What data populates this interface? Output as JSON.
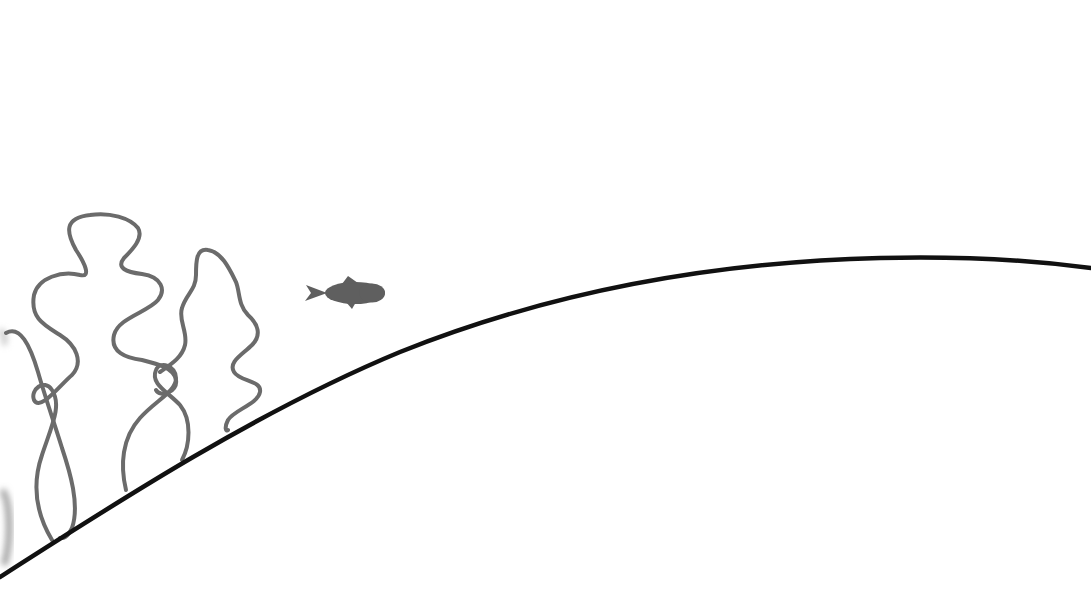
{
  "scene": {
    "description": "Underwater line illustration: seaweed and a fish above a curved seafloor",
    "background_color": "#ffffff",
    "ground": {
      "name": "seafloor-curve",
      "color": "#111111",
      "stroke_width": 4.5
    },
    "seaweed": {
      "color": "#6b6b6b",
      "stroke_width": 4,
      "strands": [
        {
          "name": "seaweed-strand-far-left"
        },
        {
          "name": "seaweed-strand-tall"
        },
        {
          "name": "seaweed-strand-middle"
        },
        {
          "name": "seaweed-strand-right"
        }
      ]
    },
    "fish": {
      "name": "fish",
      "color": "#5f5f5f",
      "facing": "right"
    },
    "edge_artifact": {
      "name": "blurred-edge-shape",
      "color": "#9a9a9a"
    }
  }
}
